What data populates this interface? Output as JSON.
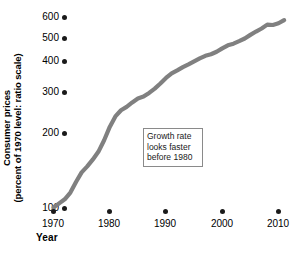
{
  "chart_data": {
    "type": "line",
    "title": "",
    "xlabel": "Year",
    "ylabel": "Consumer prices (percent of 1970 level: ratio scale)",
    "ylabel_line1": "Consumer prices",
    "ylabel_line2": "(percent of 1970 level: ratio scale)",
    "scale": "log",
    "grid": false,
    "legend": "none",
    "xlim": [
      1970,
      2012
    ],
    "ylim": [
      100,
      640
    ],
    "xticks": [
      1970,
      1980,
      1990,
      2000,
      2010
    ],
    "xtick_labels": [
      "1970",
      "1980",
      "1990",
      "2000",
      "2010"
    ],
    "yticks": [
      100,
      200,
      300,
      400,
      500,
      600
    ],
    "ytick_labels": [
      "100",
      "200",
      "300",
      "400",
      "500",
      "600"
    ],
    "series": [
      {
        "name": "Consumer prices (percent of 1970 level)",
        "color": "#808080",
        "x": [
          1970,
          1971,
          1972,
          1973,
          1974,
          1975,
          1976,
          1977,
          1978,
          1979,
          1980,
          1981,
          1982,
          1983,
          1984,
          1985,
          1986,
          1987,
          1988,
          1989,
          1990,
          1991,
          1992,
          1993,
          1994,
          1995,
          1996,
          1997,
          1998,
          1999,
          2000,
          2001,
          2002,
          2003,
          2004,
          2005,
          2006,
          2007,
          2008,
          2009,
          2010,
          2011
        ],
        "values": [
          100,
          104,
          108,
          115,
          127,
          139,
          147,
          157,
          169,
          188,
          213,
          235,
          249,
          257,
          268,
          278,
          283,
          293,
          305,
          320,
          337,
          352,
          362,
          373,
          383,
          394,
          405,
          415,
          421,
          431,
          445,
          458,
          465,
          476,
          488,
          505,
          521,
          536,
          556,
          554,
          563,
          580
        ]
      }
    ],
    "annotations": [
      {
        "id": "growth-rate-note",
        "line1": "Growth rate",
        "line2": "looks faster",
        "line3": "before 1980",
        "x_px": 143,
        "y_px": 128
      }
    ]
  }
}
